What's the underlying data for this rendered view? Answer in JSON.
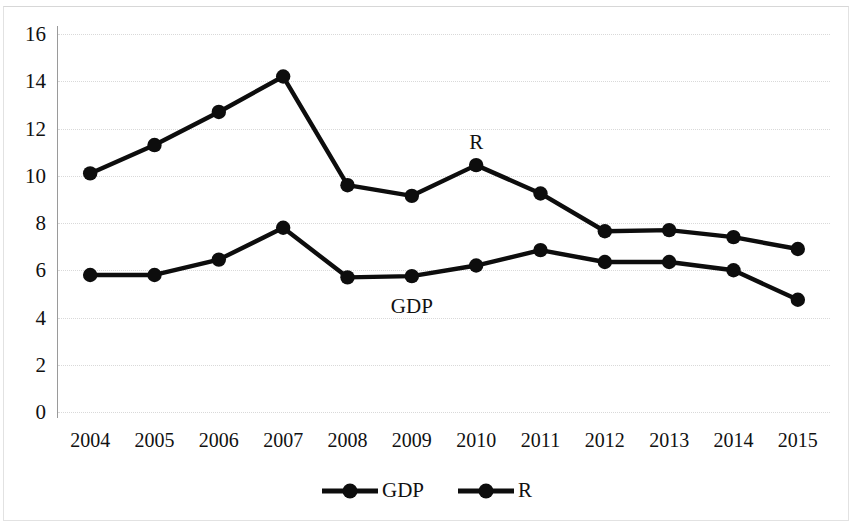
{
  "chart_data": {
    "type": "line",
    "title": "",
    "subtitle": "",
    "xlabel": "",
    "ylabel": "",
    "categories": [
      "2004",
      "2005",
      "2006",
      "2007",
      "2008",
      "2009",
      "2010",
      "2011",
      "2012",
      "2013",
      "2014",
      "2015"
    ],
    "series": [
      {
        "name": "GDP",
        "values": [
          5.8,
          5.8,
          6.45,
          7.8,
          5.7,
          5.75,
          6.2,
          6.85,
          6.35,
          6.35,
          6.0,
          4.75
        ],
        "color": "#0d0d0d",
        "marker": "filled-circle"
      },
      {
        "name": "R",
        "values": [
          10.1,
          11.3,
          12.7,
          14.2,
          9.6,
          9.15,
          10.45,
          9.25,
          7.65,
          7.7,
          7.4,
          6.9
        ],
        "color": "#0d0d0d",
        "marker": "filled-circle"
      }
    ],
    "ylim": [
      0,
      16
    ],
    "yticks": [
      0,
      2,
      4,
      6,
      8,
      10,
      12,
      14,
      16
    ],
    "ytick_labels": [
      "0",
      "2",
      "4",
      "6",
      "8",
      "10",
      "12",
      "14",
      "16"
    ],
    "grid": true,
    "grid_style": "dotted",
    "grid_color": "#d9d9d9",
    "legend": {
      "position": "bottom-center",
      "entries": [
        {
          "label": "GDP",
          "color": "#0d0d0d"
        },
        {
          "label": "R",
          "color": "#0d0d0d"
        }
      ]
    },
    "annotations": [
      {
        "text": "R",
        "x_category": "2010",
        "value": 10.45,
        "placement": "above"
      },
      {
        "text": "GDP",
        "x_category": "2009",
        "value": 5.75,
        "placement": "below"
      }
    ],
    "background_color": "#ffffff",
    "axis_color": "#9a9a9a"
  }
}
